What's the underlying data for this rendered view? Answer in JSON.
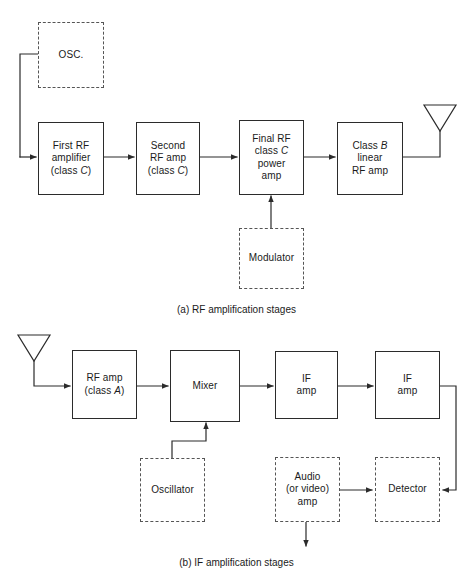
{
  "figure": {
    "line_color": "#2b2b2b",
    "dashed_color": "#555555",
    "background": "#ffffff"
  },
  "panel_a": {
    "caption": "(a) RF amplification stages",
    "blocks": {
      "osc": {
        "label": "OSC.",
        "style": "dashed"
      },
      "first_rf": {
        "line1": "First RF",
        "line2": "amplifier",
        "line3_pre": "(class ",
        "line3_em": "C",
        "line3_post": ")",
        "style": "solid"
      },
      "second_rf": {
        "line1": "Second",
        "line2": "RF  amp",
        "line3_pre": "(class ",
        "line3_em": "C",
        "line3_post": ")",
        "style": "solid"
      },
      "final_rf": {
        "line1": "Final RF",
        "line2_pre": "class ",
        "line2_em": "C",
        "line2_post": "",
        "line3": "power",
        "line4": "amp",
        "style": "solid"
      },
      "class_b": {
        "line1_pre": "Class ",
        "line1_em": "B",
        "line1_post": "",
        "line2": "linear",
        "line3": "RF  amp",
        "style": "solid"
      },
      "modulator": {
        "label": "Modulator",
        "style": "dashed"
      }
    },
    "antenna": {
      "name": "transmit-antenna"
    }
  },
  "panel_b": {
    "caption": "(b) IF amplification stages",
    "blocks": {
      "rf_amp": {
        "line1": "RF amp",
        "line2_pre": "(class ",
        "line2_em": "A",
        "line2_post": ")",
        "style": "solid"
      },
      "mixer": {
        "label": "Mixer",
        "style": "solid"
      },
      "if_amp_1": {
        "line1": "IF",
        "line2": "amp",
        "style": "solid"
      },
      "if_amp_2": {
        "line1": "IF",
        "line2": "amp",
        "style": "solid"
      },
      "oscillator": {
        "label": "Oscillator",
        "style": "dashed"
      },
      "audio_amp": {
        "line1": "Audio",
        "line2": "(or video)",
        "line3": "amp",
        "style": "dashed"
      },
      "detector": {
        "label": "Detector",
        "style": "dashed"
      }
    },
    "antenna": {
      "name": "receive-antenna"
    }
  }
}
